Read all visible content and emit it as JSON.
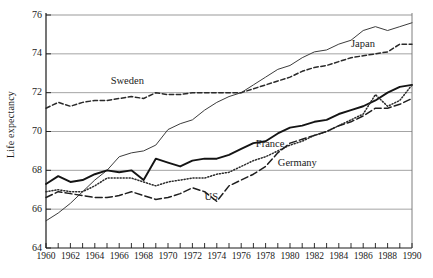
{
  "chart_data": {
    "type": "line",
    "title": "",
    "xlabel": "",
    "ylabel": "Life expectancy",
    "xlim": [
      1960,
      1990
    ],
    "ylim": [
      64,
      76
    ],
    "grid": "horizontal",
    "legend_position": "inline-annotations",
    "y_ticks": [
      64,
      66,
      68,
      70,
      72,
      74,
      76
    ],
    "x_ticks_major": [
      1960,
      1962,
      1964,
      1966,
      1968,
      1970,
      1972,
      1974,
      1976,
      1978,
      1980,
      1982,
      1984,
      1986,
      1988,
      1990
    ],
    "x_ticks_minor_every": 1,
    "x": [
      1960,
      1961,
      1962,
      1963,
      1964,
      1965,
      1966,
      1967,
      1968,
      1969,
      1970,
      1971,
      1972,
      1973,
      1974,
      1975,
      1976,
      1977,
      1978,
      1979,
      1980,
      1981,
      1982,
      1983,
      1984,
      1985,
      1986,
      1987,
      1988,
      1989,
      1990
    ],
    "series": [
      {
        "name": "Japan",
        "style": "solid-thin",
        "color": "#3c3c3c",
        "label_x": 1985.0,
        "label_y": 74.45,
        "values": [
          65.4,
          65.8,
          66.3,
          66.9,
          67.5,
          68.0,
          68.7,
          68.9,
          69.0,
          69.3,
          70.1,
          70.4,
          70.6,
          71.1,
          71.5,
          71.8,
          72.0,
          72.4,
          72.8,
          73.2,
          73.4,
          73.8,
          74.1,
          74.2,
          74.5,
          74.7,
          75.2,
          75.4,
          75.2,
          75.4,
          75.6
        ]
      },
      {
        "name": "Sweden",
        "style": "dashed",
        "color": "#2a2a2a",
        "label_x": 1965.3,
        "label_y": 72.55,
        "values": [
          71.2,
          71.5,
          71.3,
          71.5,
          71.6,
          71.6,
          71.7,
          71.8,
          71.7,
          72.0,
          71.9,
          71.9,
          72.0,
          72.0,
          72.0,
          72.0,
          72.0,
          72.2,
          72.4,
          72.6,
          72.8,
          73.1,
          73.3,
          73.4,
          73.6,
          73.8,
          73.9,
          74.0,
          74.1,
          74.5,
          74.5
        ]
      },
      {
        "name": "France",
        "style": "solid-thick",
        "color": "#141414",
        "label_x": 1977.2,
        "label_y": 69.3,
        "values": [
          67.3,
          67.7,
          67.4,
          67.5,
          67.8,
          68.0,
          67.9,
          68.0,
          67.5,
          68.6,
          68.4,
          68.2,
          68.5,
          68.6,
          68.6,
          68.8,
          69.1,
          69.4,
          69.5,
          69.9,
          70.2,
          70.3,
          70.5,
          70.6,
          70.9,
          71.1,
          71.3,
          71.6,
          72.0,
          72.3,
          72.4
        ]
      },
      {
        "name": "Germany",
        "style": "dotted",
        "color": "#2a2a2a",
        "label_x": 1979.0,
        "label_y": 68.35,
        "values": [
          66.9,
          67.0,
          66.9,
          66.9,
          67.2,
          67.6,
          67.6,
          67.6,
          67.4,
          67.2,
          67.4,
          67.5,
          67.6,
          67.6,
          67.8,
          67.9,
          68.2,
          68.5,
          68.7,
          69.0,
          69.3,
          69.5,
          69.8,
          70.0,
          70.3,
          70.6,
          70.9,
          71.9,
          71.3,
          71.6,
          72.4
        ]
      },
      {
        "name": "US",
        "style": "long-dash",
        "color": "#1f1f1f",
        "label_x": 1973.0,
        "label_y": 66.6,
        "values": [
          66.6,
          66.9,
          66.8,
          66.7,
          66.6,
          66.6,
          66.7,
          66.9,
          66.7,
          66.5,
          66.6,
          66.8,
          67.1,
          66.9,
          66.4,
          67.2,
          67.5,
          67.8,
          68.2,
          68.9,
          69.4,
          69.6,
          69.8,
          70.0,
          70.3,
          70.5,
          70.8,
          71.2,
          71.2,
          71.4,
          71.7
        ]
      }
    ]
  }
}
